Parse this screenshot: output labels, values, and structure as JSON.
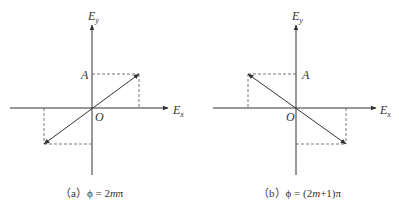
{
  "figures": [
    {
      "id": "a",
      "axis_x_label": "E",
      "axis_x_sub": "x",
      "axis_y_label": "E",
      "axis_y_sub": "y",
      "amplitude_label": "A",
      "origin_label": "O",
      "caption_prefix": "（a）",
      "caption_phi": "ϕ",
      "caption_eq": " = 2",
      "caption_m": "m",
      "caption_tail": "π",
      "polarization": "linear, positive slope (1st–3rd quadrant)"
    },
    {
      "id": "b",
      "axis_x_label": "E",
      "axis_x_sub": "x",
      "axis_y_label": "E",
      "axis_y_sub": "y",
      "amplitude_label": "A",
      "origin_label": "O",
      "caption_prefix": "（b）",
      "caption_phi": "ϕ",
      "caption_eq": " = (2",
      "caption_m": "m",
      "caption_tail": "+1)π",
      "polarization": "linear, negative slope (2nd–4th quadrant)"
    }
  ],
  "colors": {
    "line": "#333333",
    "dash": "#555555"
  }
}
